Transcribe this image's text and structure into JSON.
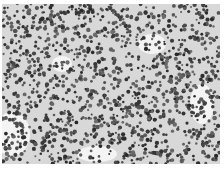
{
  "image": {
    "subject": "grayscale histology micrograph",
    "description": "densely packed small round dark nuclei on light gray background",
    "colors": {
      "background": "#ffffff",
      "tissue": "#d8d8d8",
      "nuclei": "#3a3a3a",
      "gaps": "#f4f4f4"
    }
  }
}
